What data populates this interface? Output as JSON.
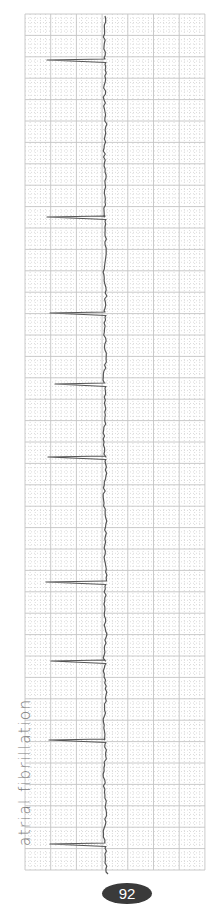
{
  "strip": {
    "caption": "atrial fibrillation",
    "page_number": "92"
  },
  "colors": {
    "background": "#ffffff",
    "grid_major": "#c4c4c4",
    "grid_minor": "#d2d2d2",
    "trace": "#555555",
    "caption": "#7a7a7a",
    "badge": "#3a3a3a"
  },
  "chart_data": {
    "type": "line",
    "title": "atrial fibrillation",
    "orientation": "vertical (time runs top to bottom)",
    "grid": {
      "left": 25,
      "right": 205,
      "top": 14,
      "bottom": 870,
      "major_x_spacing_px": 25.7,
      "major_y_spacing_px": 21.4,
      "minor_divisions": 5
    },
    "baseline_x": 105,
    "qrs_spikes": [
      {
        "y": 60,
        "tip_x": 47
      },
      {
        "y": 217,
        "tip_x": 47
      },
      {
        "y": 313,
        "tip_x": 50
      },
      {
        "y": 384,
        "tip_x": 55
      },
      {
        "y": 457,
        "tip_x": 48
      },
      {
        "y": 582,
        "tip_x": 46
      },
      {
        "y": 661,
        "tip_x": 51
      },
      {
        "y": 740,
        "tip_x": 49
      },
      {
        "y": 844,
        "tip_x": 50
      }
    ],
    "rhythm": "irregularly irregular, no distinct P waves, fibrillatory baseline"
  }
}
